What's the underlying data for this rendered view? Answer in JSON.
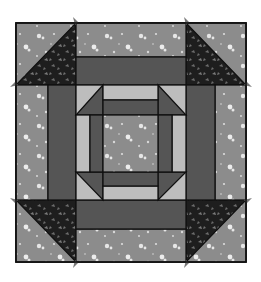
{
  "figure": {
    "title": "Quilt block diagram",
    "colors": {
      "background_speckle": "#8c8c8c",
      "speckle_dot": "#e6e6e6",
      "dark_bar": "#555555",
      "light_strip": "#bdbdbd",
      "leaf_print": "#1e1e1e",
      "leaf_motif": "#7a7a7a",
      "seam": "#111111",
      "page": "#ffffff"
    },
    "grid_x": [
      16,
      48,
      76,
      103,
      158,
      186,
      215,
      246
    ],
    "grid_y": [
      23,
      57,
      85,
      115,
      172,
      200,
      229,
      262
    ]
  }
}
